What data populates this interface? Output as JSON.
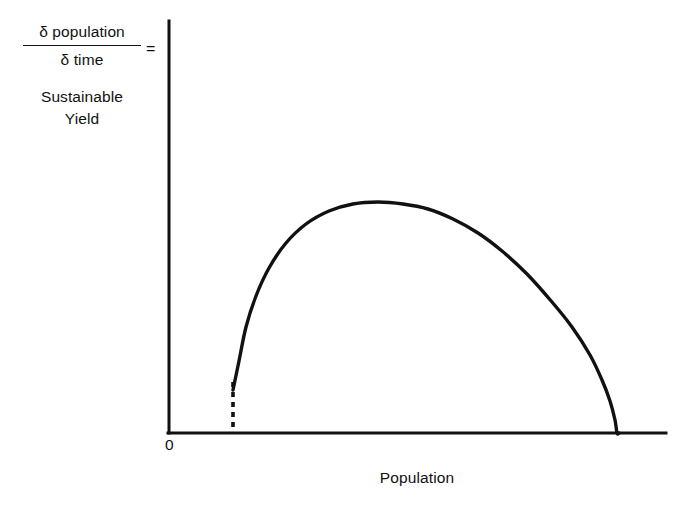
{
  "figure": {
    "background_color": "#ffffff",
    "ink_color": "#111111"
  },
  "axes": {
    "origin_label": "0",
    "x_title": "Population",
    "y_title_numerator": "δ population",
    "y_title_denominator": "δ time",
    "y_title_equals": "=",
    "y_title_line1": "Sustainable",
    "y_title_line2": "Yield"
  },
  "chart_data": {
    "type": "line",
    "title": "",
    "xlabel": "Population",
    "ylabel": "δ population / δ time = Sustainable Yield",
    "xlim": [
      0,
      1
    ],
    "ylim": [
      0,
      1
    ],
    "grid": false,
    "legend": null,
    "annotations": [
      {
        "name": "minimum-viable-population-dashline",
        "style": "dashed-vertical",
        "x": 0.129,
        "y_from": 0.0,
        "y_to": 0.105
      }
    ],
    "series": [
      {
        "name": "sustainable-yield-curve",
        "style": "solid",
        "linewidth": 3.2,
        "x": [
          0.129,
          0.14,
          0.155,
          0.175,
          0.2,
          0.235,
          0.275,
          0.32,
          0.37,
          0.42,
          0.47,
          0.52,
          0.57,
          0.62,
          0.67,
          0.72,
          0.77,
          0.81,
          0.845,
          0.87,
          0.885,
          0.895,
          0.9,
          0.903
        ],
        "y": [
          0.105,
          0.175,
          0.255,
          0.33,
          0.395,
          0.455,
          0.5,
          0.53,
          0.548,
          0.552,
          0.548,
          0.535,
          0.512,
          0.48,
          0.438,
          0.385,
          0.32,
          0.262,
          0.198,
          0.14,
          0.09,
          0.045,
          0.015,
          0.0
        ],
        "x_pixels": [
          233,
          239,
          246,
          256,
          269,
          286,
          306,
          329,
          353,
          378,
          403,
          428,
          453,
          478,
          502,
          527,
          552,
          572,
          590,
          602,
          610,
          615,
          617,
          619
        ],
        "y_pixels": [
          390,
          361,
          327,
          296,
          268,
          243,
          224,
          211,
          204,
          202,
          204,
          209,
          219,
          233,
          251,
          274,
          302,
          327,
          355,
          380,
          401,
          420,
          433,
          433
        ]
      }
    ]
  }
}
